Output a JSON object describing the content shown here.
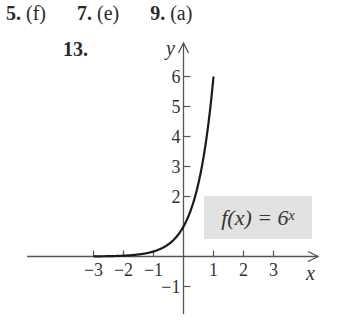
{
  "answers": [
    {
      "number": "5.",
      "answer": "(f)"
    },
    {
      "number": "7.",
      "answer": "(e)"
    },
    {
      "number": "9.",
      "answer": "(a)"
    }
  ],
  "problem": {
    "number": "13."
  },
  "chart_data": {
    "type": "line",
    "title": "",
    "function_label": {
      "prefix": "f(x) = 6",
      "exponent": "x"
    },
    "xlabel": "x",
    "ylabel": "y",
    "xlim": [
      -3.0,
      4.4
    ],
    "ylim": [
      -1.5,
      6.5
    ],
    "xticks": [
      -3,
      -2,
      -1,
      1,
      2,
      3
    ],
    "xtick_labels": [
      "−3",
      "−2",
      "−1",
      "1",
      "2",
      "3"
    ],
    "yticks": [
      -1,
      2,
      3,
      4,
      5,
      6
    ],
    "ytick_labels": [
      "−1",
      "2",
      "3",
      "4",
      "5",
      "6"
    ],
    "grid": false,
    "series": [
      {
        "name": "f(x) = 6^x",
        "x": [
          -3,
          -2.5,
          -2,
          -1.5,
          -1,
          -0.75,
          -0.5,
          -0.25,
          0,
          0.25,
          0.5,
          0.75,
          1
        ],
        "y": [
          0.0046,
          0.0113,
          0.0278,
          0.068,
          0.1667,
          0.261,
          0.408,
          0.639,
          1,
          1.565,
          2.449,
          3.834,
          6
        ]
      }
    ]
  }
}
